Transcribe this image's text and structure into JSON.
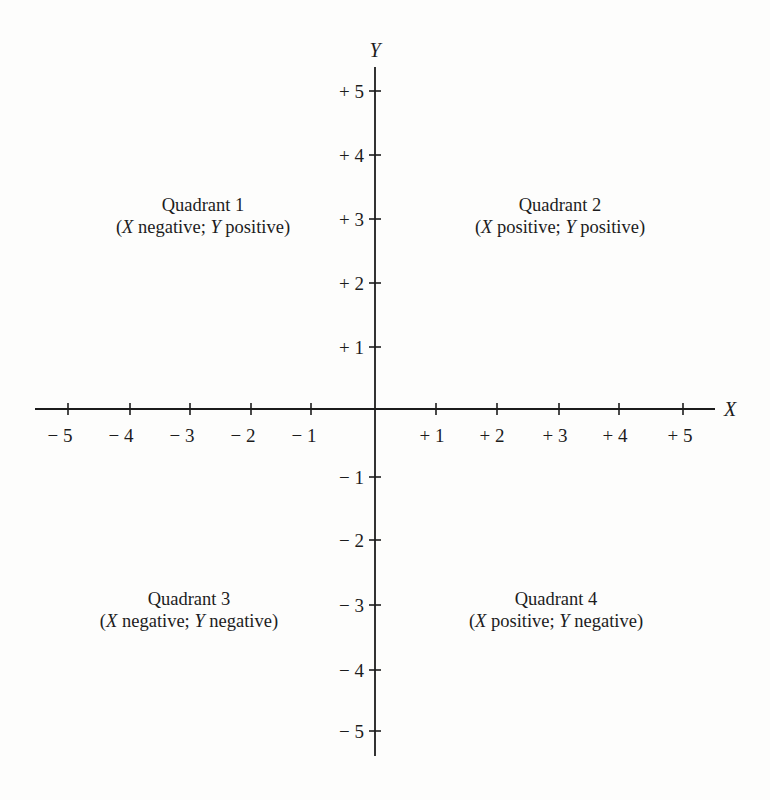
{
  "diagram": {
    "type": "cartesian-coordinate-plane",
    "axes": {
      "x": {
        "label": "X",
        "ticks": [
          "− 5",
          "− 4",
          "− 3",
          "− 2",
          "− 1",
          "+ 1",
          "+ 2",
          "+ 3",
          "+ 4",
          "+ 5"
        ]
      },
      "y": {
        "label": "Y",
        "ticks": [
          "+ 5",
          "+ 4",
          "+ 3",
          "+ 2",
          "+ 1",
          "− 1",
          "− 2",
          "− 3",
          "− 4",
          "− 5"
        ]
      }
    },
    "quadrants": [
      {
        "title": "Quadrant 1",
        "open": "(",
        "xvar": "X",
        "xsign": " negative; ",
        "yvar": "Y",
        "ysign": " positive)"
      },
      {
        "title": "Quadrant 2",
        "open": "(",
        "xvar": "X",
        "xsign": " positive; ",
        "yvar": "Y",
        "ysign": " positive)"
      },
      {
        "title": "Quadrant 3",
        "open": "(",
        "xvar": "X",
        "xsign": " negative; ",
        "yvar": "Y",
        "ysign": " negative)"
      },
      {
        "title": "Quadrant 4",
        "open": "(",
        "xvar": "X",
        "xsign": " positive; ",
        "yvar": "Y",
        "ysign": " negative)"
      }
    ],
    "colors": {
      "ink": "#1c1c1c",
      "paper": "#fdfdfc"
    }
  }
}
